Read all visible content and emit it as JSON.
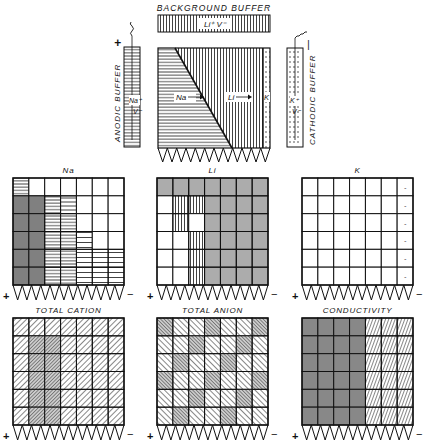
{
  "top": {
    "background_buffer_label": "BACKGROUND BUFFER",
    "background_buffer_ions": "Li⁺ V⁻",
    "anodic_buffer_label": "ANODIC BUFFER",
    "anodic_buffer_ions_cation": "Na⁺",
    "anodic_buffer_ions_anion": "V⁻",
    "anodic_polarity": "+",
    "cathodic_buffer_label": "CATHODIC BUFFER",
    "cathodic_buffer_ions_cation": "K⁺",
    "cathodic_buffer_ions_anion": "V⁻",
    "cathodic_polarity": "−",
    "column_zone_na": "Na",
    "column_zone_li": "Li",
    "column_zone_k": "K"
  },
  "panels": [
    {
      "id": "na",
      "title": "Na",
      "plus": "+",
      "minus": "−"
    },
    {
      "id": "li",
      "title": "Li",
      "plus": "+",
      "minus": "−"
    },
    {
      "id": "k",
      "title": "K",
      "plus": "+",
      "minus": "−",
      "column_marks": [
        "-",
        "-",
        "-",
        "-",
        "-",
        "-"
      ]
    },
    {
      "id": "total-cation",
      "title": "TOTAL CATION",
      "plus": "+",
      "minus": "−"
    },
    {
      "id": "total-anion",
      "title": "TOTAL ANION",
      "plus": "+",
      "minus": "−"
    },
    {
      "id": "conductivity",
      "title": "CONDUCTIVITY",
      "plus": "+",
      "minus": "−"
    }
  ],
  "grid": {
    "columns": 7,
    "rows": 6,
    "zigzag_teeth": 12
  },
  "colors": {
    "ink": "#111111",
    "background": "#ffffff",
    "shade": "#9a9a9a"
  }
}
